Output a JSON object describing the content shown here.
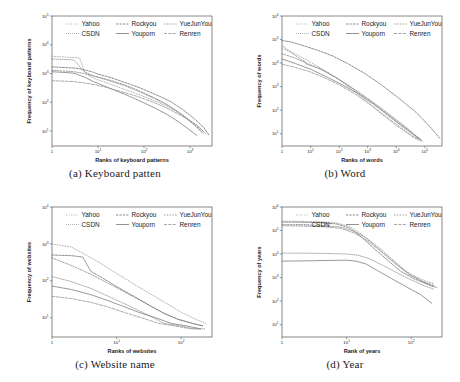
{
  "figure": {
    "panel_count": 4
  },
  "legend": {
    "entries": [
      {
        "label": "Yahoo",
        "color": "#9a9a9a",
        "dash": "1,1.6"
      },
      {
        "label": "Rockyou",
        "color": "#6b6b6b",
        "dash": "2.2,1.2"
      },
      {
        "label": "YueJunYou",
        "color": "#7d7d7d",
        "dash": "1.4,1.4"
      },
      {
        "label": "CSDN",
        "color": "#8a8a8a",
        "dash": "0.8,1.2"
      },
      {
        "label": "Youporn",
        "color": "#777777",
        "dash": "none"
      },
      {
        "label": "Renren",
        "color": "#8f8f8f",
        "dash": "3,1.4"
      }
    ],
    "row1": [
      "Yahoo",
      "Rockyou",
      "YueJunYou"
    ],
    "row2": [
      "CSDN",
      "Youporn",
      "Renren"
    ]
  },
  "chart_data": [
    {
      "id": "a",
      "type": "line",
      "caption": "(a) Keyboard patten",
      "caption_index": "(a)",
      "caption_text": "Keyboard patten",
      "xlabel": "Ranks of  keyboard patterns",
      "ylabel": "Frequency of keyboard patterns",
      "xscale": "log",
      "yscale": "log",
      "xlim": [
        1,
        3000
      ],
      "ylim": [
        3,
        100000
      ],
      "xticks": [
        "1",
        "10^1",
        "10^2",
        "10^3"
      ],
      "xtick_values": [
        1,
        10,
        100,
        1000
      ],
      "yticks": [
        "10^1",
        "10^2",
        "10^3",
        "10^4",
        "10^5"
      ],
      "ytick_values": [
        10,
        100,
        1000,
        10000,
        100000
      ],
      "grid": false,
      "legend_position": "top-inside",
      "series": [
        {
          "name": "Yahoo",
          "x": [
            1,
            2,
            3,
            4,
            5,
            6,
            8,
            10,
            15,
            20,
            30,
            50,
            80,
            120,
            200,
            350,
            600,
            900,
            1400,
            2000
          ],
          "y": [
            4000,
            3700,
            3600,
            3500,
            1200,
            900,
            700,
            600,
            480,
            400,
            320,
            240,
            180,
            140,
            100,
            65,
            40,
            24,
            14,
            8
          ]
        },
        {
          "name": "Rockyou",
          "x": [
            1,
            2,
            3,
            4,
            6,
            8,
            10,
            15,
            20,
            30,
            50,
            80,
            130,
            220,
            400,
            700,
            1200,
            2000,
            2600
          ],
          "y": [
            1700,
            1600,
            1550,
            1450,
            1250,
            1100,
            950,
            800,
            700,
            560,
            420,
            320,
            230,
            160,
            100,
            55,
            28,
            13,
            7
          ]
        },
        {
          "name": "YueJunYou",
          "x": [
            1,
            2,
            3,
            5,
            8,
            12,
            20,
            35,
            60,
            100,
            170,
            300,
            500,
            800,
            1200,
            1800
          ],
          "y": [
            1300,
            1200,
            1150,
            1000,
            820,
            700,
            560,
            420,
            300,
            210,
            140,
            88,
            52,
            30,
            17,
            9
          ]
        },
        {
          "name": "CSDN",
          "x": [
            1,
            2,
            3,
            5,
            8,
            12,
            20,
            35,
            60,
            100,
            180,
            320,
            560,
            900,
            1500,
            2200
          ],
          "y": [
            3200,
            3050,
            2950,
            1150,
            820,
            680,
            520,
            390,
            280,
            195,
            128,
            78,
            45,
            26,
            15,
            8
          ]
        },
        {
          "name": "Youporn",
          "x": [
            1,
            2,
            3,
            5,
            8,
            13,
            22,
            38,
            65,
            110,
            190,
            330,
            560,
            900,
            1400
          ],
          "y": [
            1150,
            1080,
            1020,
            760,
            520,
            380,
            270,
            190,
            130,
            88,
            58,
            36,
            21,
            12,
            7
          ]
        },
        {
          "name": "Renren",
          "x": [
            1,
            2,
            3,
            5,
            9,
            15,
            25,
            45,
            80,
            140,
            250,
            430,
            750,
            1200,
            1900
          ],
          "y": [
            560,
            540,
            520,
            470,
            400,
            330,
            260,
            200,
            150,
            108,
            74,
            48,
            30,
            18,
            10
          ]
        }
      ]
    },
    {
      "id": "b",
      "type": "line",
      "caption": "(b) Word",
      "caption_index": "(b)",
      "caption_text": "Word",
      "xlabel": "Ranks of words",
      "ylabel": "Frequency of words",
      "xscale": "log",
      "yscale": "log",
      "xlim": [
        1,
        400000
      ],
      "ylim": [
        3,
        1000000
      ],
      "xticks": [
        "1",
        "10^1",
        "10^2",
        "10^3",
        "10^4",
        "10^5"
      ],
      "xtick_values": [
        1,
        10,
        100,
        1000,
        10000,
        100000
      ],
      "yticks": [
        "10^1",
        "10^2",
        "10^3",
        "10^4",
        "10^5",
        "10^6"
      ],
      "ytick_values": [
        10,
        100,
        1000,
        10000,
        100000,
        1000000
      ],
      "grid": false,
      "legend_position": "top-inside",
      "series": [
        {
          "name": "Yahoo",
          "x": [
            1,
            3,
            10,
            30,
            100,
            300,
            1000,
            3000,
            10000,
            30000,
            60000
          ],
          "y": [
            42000,
            24000,
            11000,
            5000,
            2000,
            700,
            220,
            70,
            22,
            9,
            5
          ]
        },
        {
          "name": "Rockyou",
          "x": [
            1,
            2,
            4,
            8,
            20,
            60,
            200,
            800,
            3000,
            12000,
            50000,
            150000,
            350000
          ],
          "y": [
            90000,
            80000,
            62000,
            48000,
            33000,
            20000,
            9500,
            3600,
            1200,
            330,
            80,
            20,
            6
          ]
        },
        {
          "name": "YueJunYou",
          "x": [
            1,
            3,
            8,
            25,
            80,
            250,
            900,
            3000,
            10000,
            30000,
            70000
          ],
          "y": [
            25000,
            16000,
            9500,
            5200,
            2400,
            950,
            320,
            110,
            35,
            13,
            6
          ]
        },
        {
          "name": "CSDN",
          "x": [
            1,
            2,
            5,
            6,
            7,
            20,
            70,
            250,
            900,
            3000,
            10000,
            30000,
            60000
          ],
          "y": [
            55000,
            30000,
            13000,
            12500,
            9000,
            6000,
            2600,
            1000,
            350,
            120,
            40,
            14,
            6
          ]
        },
        {
          "name": "Youporn",
          "x": [
            1,
            3,
            10,
            30,
            100,
            400,
            1500,
            5000,
            15000,
            40000,
            80000
          ],
          "y": [
            15000,
            9500,
            5500,
            2900,
            1400,
            560,
            190,
            62,
            22,
            9,
            5
          ]
        },
        {
          "name": "Renren",
          "x": [
            1,
            3,
            10,
            30,
            100,
            350,
            1200,
            4000,
            13000,
            35000,
            75000
          ],
          "y": [
            9000,
            6500,
            4200,
            2400,
            1200,
            500,
            175,
            58,
            20,
            8,
            5
          ]
        }
      ]
    },
    {
      "id": "c",
      "type": "line",
      "caption": "(c) Website name",
      "caption_index": "(c)",
      "caption_text": "Website name",
      "xlabel": "Ranks of  websites",
      "ylabel": "Frequency of websites",
      "xscale": "log",
      "yscale": "log",
      "xlim": [
        1,
        300
      ],
      "ylim": [
        3,
        10000
      ],
      "xticks": [
        "1",
        "10^1",
        "10^2"
      ],
      "xtick_values": [
        1,
        10,
        100
      ],
      "yticks": [
        "10^1",
        "10^2",
        "10^3",
        "10^4"
      ],
      "ytick_values": [
        10,
        100,
        1000,
        10000
      ],
      "grid": false,
      "legend_position": "top-inside",
      "series": [
        {
          "name": "Yahoo",
          "x": [
            1,
            2,
            3,
            5,
            8,
            13,
            20,
            35,
            60,
            100,
            170,
            240
          ],
          "y": [
            1000,
            820,
            560,
            340,
            200,
            120,
            75,
            42,
            24,
            14,
            9,
            7
          ]
        },
        {
          "name": "Rockyou",
          "x": [
            1,
            2,
            3,
            4,
            6,
            9,
            14,
            22,
            35,
            55,
            90,
            150,
            220
          ],
          "y": [
            500,
            480,
            440,
            180,
            120,
            78,
            50,
            32,
            20,
            13,
            9,
            7,
            6
          ]
        },
        {
          "name": "YueJunYou",
          "x": [
            1,
            2,
            4,
            7,
            12,
            20,
            33,
            55,
            90,
            150,
            210
          ],
          "y": [
            420,
            260,
            150,
            90,
            55,
            34,
            21,
            13,
            9,
            7,
            6
          ]
        },
        {
          "name": "CSDN",
          "x": [
            1,
            2,
            4,
            7,
            12,
            20,
            33,
            55,
            95,
            160,
            230
          ],
          "y": [
            130,
            95,
            62,
            40,
            26,
            17,
            11,
            7,
            6,
            5,
            5
          ]
        },
        {
          "name": "Youporn",
          "x": [
            1,
            2,
            4,
            7,
            12,
            22,
            40,
            70,
            120,
            200
          ],
          "y": [
            72,
            58,
            42,
            30,
            21,
            14,
            10,
            7,
            6,
            5
          ]
        },
        {
          "name": "Renren",
          "x": [
            1,
            2,
            4,
            7,
            13,
            24,
            45,
            80,
            140,
            200
          ],
          "y": [
            38,
            33,
            26,
            20,
            14,
            10,
            7,
            6,
            5,
            5
          ]
        }
      ]
    },
    {
      "id": "d",
      "type": "line",
      "caption": "(d) Year",
      "caption_index": "(d)",
      "caption_text": "Year",
      "xlabel": "Rank of years",
      "ylabel": "Frequency of years",
      "xscale": "log",
      "yscale": "log",
      "xlim": [
        1,
        300
      ],
      "ylim": [
        3,
        1000000
      ],
      "xticks": [
        "1",
        "10^1",
        "10^2"
      ],
      "xtick_values": [
        1,
        10,
        100
      ],
      "yticks": [
        "10^1",
        "10^2",
        "10^3",
        "10^4",
        "10^5",
        "10^6"
      ],
      "ytick_values": [
        10,
        100,
        1000,
        10000,
        100000,
        1000000
      ],
      "grid": false,
      "legend_position": "top-inside",
      "series": [
        {
          "name": "Yahoo",
          "x": [
            1,
            2,
            4,
            7,
            11,
            16,
            24,
            40,
            70,
            110,
            170,
            230
          ],
          "y": [
            250000,
            245000,
            235000,
            210000,
            150000,
            80000,
            30000,
            9000,
            2500,
            1200,
            700,
            550
          ]
        },
        {
          "name": "Rockyou",
          "x": [
            1,
            2,
            4,
            7,
            11,
            16,
            24,
            40,
            70,
            110,
            170,
            230
          ],
          "y": [
            230000,
            225000,
            215000,
            190000,
            130000,
            62000,
            22000,
            6500,
            1800,
            900,
            550,
            420
          ]
        },
        {
          "name": "YueJunYou",
          "x": [
            1,
            2,
            4,
            8,
            13,
            20,
            32,
            55,
            90,
            140,
            200,
            250
          ],
          "y": [
            180000,
            175000,
            165000,
            140000,
            95000,
            50000,
            18000,
            5000,
            1500,
            750,
            450,
            380
          ]
        },
        {
          "name": "CSDN",
          "x": [
            1,
            3,
            6,
            10,
            15,
            22,
            35,
            60,
            100,
            160,
            220
          ],
          "y": [
            11000,
            10800,
            10500,
            10000,
            9000,
            6500,
            3500,
            1600,
            800,
            450,
            330
          ]
        },
        {
          "name": "Youporn",
          "x": [
            1,
            3,
            6,
            10,
            14,
            20,
            30,
            50,
            85,
            140,
            210
          ],
          "y": [
            5000,
            5200,
            5400,
            5500,
            5000,
            3800,
            2000,
            900,
            400,
            190,
            80
          ]
        },
        {
          "name": "Renren",
          "x": [
            1,
            2,
            4,
            8,
            13,
            20,
            33,
            55,
            95,
            150,
            220
          ],
          "y": [
            160000,
            155000,
            148000,
            125000,
            80000,
            40000,
            14000,
            4200,
            1300,
            700,
            480
          ]
        }
      ]
    }
  ]
}
